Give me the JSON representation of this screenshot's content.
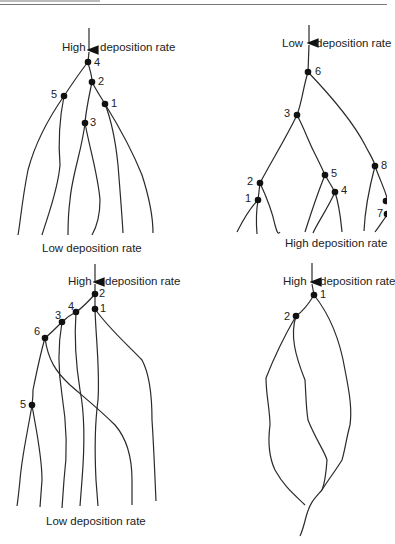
{
  "panels": [
    {
      "id": "top-left",
      "top_label_left": "High",
      "top_label_right": "deposition rate",
      "bottom_label": "Low deposition rate",
      "nodes": [
        "4",
        "2",
        "5",
        "1",
        "3"
      ]
    },
    {
      "id": "top-right",
      "top_label_left": "Low",
      "top_label_right": "deposition rate",
      "bottom_label": "High deposition rate",
      "nodes": [
        "6",
        "3",
        "2",
        "1",
        "5",
        "4",
        "8",
        "7"
      ]
    },
    {
      "id": "bottom-left",
      "top_label_left": "High",
      "top_label_right": "deposition rate",
      "bottom_label": "Low deposition rate",
      "nodes": [
        "2",
        "1",
        "4",
        "3",
        "6",
        "5"
      ]
    },
    {
      "id": "bottom-right",
      "top_label_left": "High",
      "top_label_right": "deposition rate",
      "bottom_label": "",
      "nodes": [
        "1",
        "2"
      ]
    }
  ],
  "colors": {
    "line": "#2a2a2a",
    "text": "#222222",
    "rule": "#777777"
  }
}
